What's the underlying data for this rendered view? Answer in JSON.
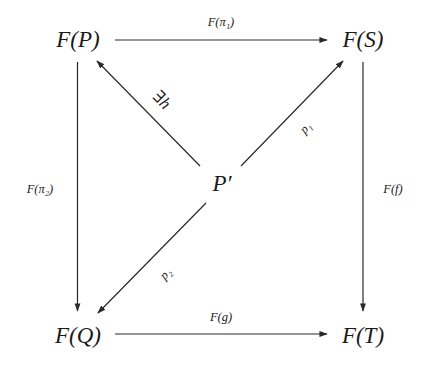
{
  "diagram": {
    "type": "commutative-diagram",
    "colors": {
      "line": "#2a2a2a",
      "text": "#1a1a1a",
      "background": "#ffffff"
    },
    "nodes": {
      "fp": {
        "label": "F(P)",
        "x": 78,
        "y": 40
      },
      "fs": {
        "label": "F(S)",
        "x": 363,
        "y": 40
      },
      "fq": {
        "label": "F(Q)",
        "x": 78,
        "y": 336
      },
      "ft": {
        "label": "F(T)",
        "x": 363,
        "y": 336
      },
      "pp": {
        "label": "P′",
        "x": 222,
        "y": 185
      }
    },
    "edges": {
      "top": {
        "from": "F(P)",
        "to": "F(S)",
        "label": "F(π₁)"
      },
      "left": {
        "from": "F(P)",
        "to": "F(Q)",
        "label": "F(π₂)"
      },
      "right": {
        "from": "F(S)",
        "to": "F(T)",
        "label": "F(f)"
      },
      "bottom": {
        "from": "F(Q)",
        "to": "F(T)",
        "label": "F(g)"
      },
      "h": {
        "from": "P′",
        "to": "F(P)",
        "label": "∃h"
      },
      "p1": {
        "from": "P′",
        "to": "F(S)",
        "label": "p₁"
      },
      "p2": {
        "from": "P′",
        "to": "F(Q)",
        "label": "p₂"
      }
    }
  }
}
